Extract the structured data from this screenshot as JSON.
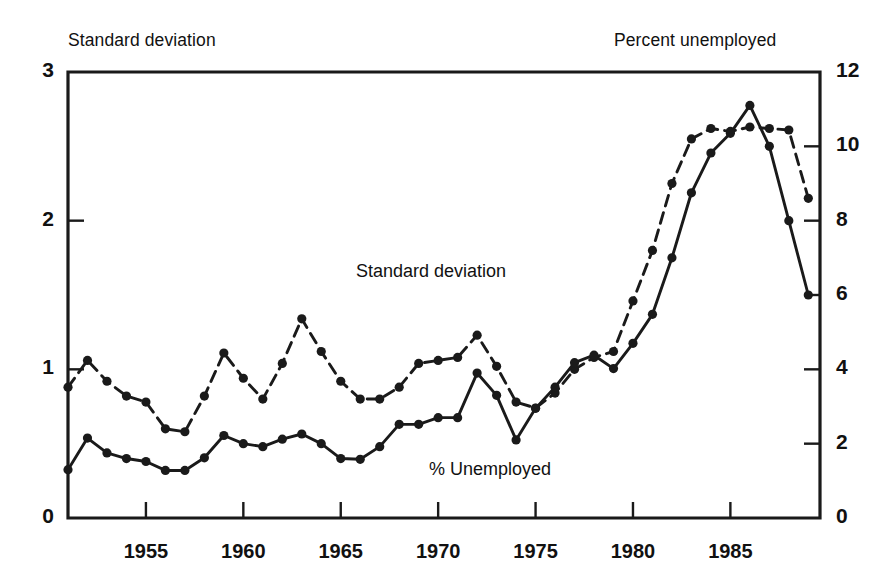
{
  "axis_titles": {
    "left": "Standard deviation",
    "right": "Percent unemployed"
  },
  "inner_labels": {
    "standard_deviation": "Standard deviation",
    "percent_unemployed": "% Unemployed"
  },
  "left_axis": {
    "ticks": [
      "0",
      "1",
      "2",
      "3"
    ]
  },
  "right_axis": {
    "ticks": [
      "0",
      "2",
      "4",
      "6",
      "8",
      "10",
      "12"
    ]
  },
  "x_axis": {
    "ticks": [
      "1955",
      "1960",
      "1965",
      "1970",
      "1975",
      "1980",
      "1985"
    ]
  },
  "colors": {
    "ink": "#1a1a1a",
    "background": "#ffffff"
  },
  "chart_data": {
    "type": "line",
    "title": "",
    "subtitle": "",
    "xlabel": "",
    "ylabel": "Standard deviation",
    "y2label": "Percent unemployed",
    "grid": false,
    "legend_position": "inline-annotations",
    "xlim": [
      1951,
      1989.6
    ],
    "ylim": [
      0,
      3
    ],
    "y2lim": [
      0,
      12
    ],
    "xticks": [
      1955,
      1960,
      1965,
      1970,
      1975,
      1980,
      1985
    ],
    "yticks": [
      0,
      1,
      2,
      3
    ],
    "y2ticks": [
      0,
      2,
      4,
      6,
      8,
      10,
      12
    ],
    "annotations": [
      {
        "text": "Standard deviation",
        "x": 1969,
        "y": 1.63
      },
      {
        "text": "% Unemployed",
        "x": 1973,
        "y": 0.36
      }
    ],
    "series": [
      {
        "name": "Standard deviation",
        "axis": "left",
        "style": "dashed",
        "marker": "filled-circle",
        "x": [
          1951,
          1952,
          1953,
          1954,
          1955,
          1956,
          1957,
          1958,
          1959,
          1960,
          1961,
          1962,
          1963,
          1964,
          1965,
          1966,
          1967,
          1968,
          1969,
          1970,
          1971,
          1972,
          1973,
          1974,
          1975,
          1976,
          1977,
          1978,
          1979,
          1980,
          1981,
          1982,
          1983,
          1984,
          1985,
          1986,
          1987,
          1988,
          1989
        ],
        "y": [
          0.88,
          1.06,
          0.92,
          0.82,
          0.78,
          0.6,
          0.58,
          0.82,
          1.11,
          0.94,
          0.8,
          1.04,
          1.34,
          1.12,
          0.92,
          0.8,
          0.8,
          0.88,
          1.04,
          1.06,
          1.08,
          1.23,
          1.02,
          0.78,
          0.74,
          0.84,
          1.0,
          1.08,
          1.12,
          1.46,
          1.8,
          2.25,
          2.55,
          2.62,
          2.6,
          2.63,
          2.62,
          2.61,
          2.15
        ]
      },
      {
        "name": "% Unemployed",
        "axis": "right",
        "style": "solid",
        "marker": "filled-circle",
        "x": [
          1951,
          1952,
          1953,
          1954,
          1955,
          1956,
          1957,
          1958,
          1959,
          1960,
          1961,
          1962,
          1963,
          1964,
          1965,
          1966,
          1967,
          1968,
          1969,
          1970,
          1971,
          1972,
          1973,
          1974,
          1975,
          1976,
          1977,
          1978,
          1979,
          1980,
          1981,
          1982,
          1983,
          1984,
          1985,
          1986,
          1987,
          1988,
          1989
        ],
        "y": [
          1.3,
          2.15,
          1.75,
          1.6,
          1.52,
          1.28,
          1.28,
          1.62,
          2.22,
          2.0,
          1.92,
          2.12,
          2.26,
          2.0,
          1.6,
          1.58,
          1.92,
          2.52,
          2.52,
          2.7,
          2.7,
          3.9,
          3.3,
          2.1,
          2.95,
          3.52,
          4.18,
          4.38,
          4.02,
          4.7,
          5.48,
          7.0,
          8.75,
          9.82,
          10.35,
          11.1,
          10.0,
          8.0,
          6.0
        ]
      }
    ]
  }
}
